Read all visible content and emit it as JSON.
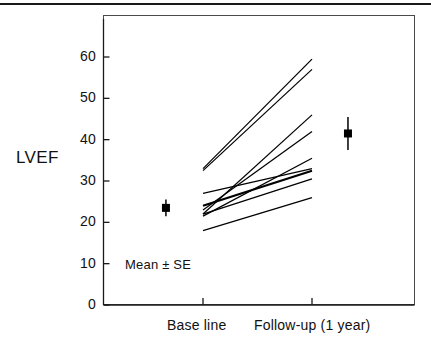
{
  "figure": {
    "axis_title_y": "LVEF",
    "annotation": "Mean ± SE",
    "rule_color": "#1a1a1a",
    "line_color": "#000000",
    "frame_color": "#4a4a4a"
  },
  "chart_data": {
    "type": "line",
    "title": "",
    "xlabel": "",
    "ylabel": "LVEF",
    "categories": [
      "Base line",
      "Follow-up (1 year)"
    ],
    "x": [
      0,
      1
    ],
    "ylim": [
      0,
      68
    ],
    "xlim": [
      -0.92,
      1.93
    ],
    "yticks": [
      0,
      10,
      20,
      30,
      40,
      50,
      60
    ],
    "ytick_labels": [
      "0",
      "10",
      "20",
      "30",
      "40",
      "50",
      "60"
    ],
    "xtick_labels": [
      "Base line",
      "Follow-up (1 year)"
    ],
    "grid": false,
    "legend": "none",
    "annotations": [
      {
        "text": "Mean ± SE",
        "x": 0.22,
        "y": 10
      }
    ],
    "series": [
      {
        "name": "patient-1",
        "values": [
          33.0,
          59.5
        ],
        "emphasis": false
      },
      {
        "name": "patient-2",
        "values": [
          32.5,
          57.0
        ],
        "emphasis": false
      },
      {
        "name": "patient-3",
        "values": [
          22.0,
          46.0
        ],
        "emphasis": false
      },
      {
        "name": "patient-4",
        "values": [
          23.0,
          42.0
        ],
        "emphasis": false
      },
      {
        "name": "patient-5",
        "values": [
          21.5,
          35.5
        ],
        "emphasis": false
      },
      {
        "name": "patient-6",
        "values": [
          27.0,
          33.0
        ],
        "emphasis": false
      },
      {
        "name": "patient-7",
        "values": [
          24.0,
          32.5
        ],
        "emphasis": true
      },
      {
        "name": "patient-8",
        "values": [
          22.0,
          30.5
        ],
        "emphasis": false
      },
      {
        "name": "patient-9",
        "values": [
          18.0,
          26.0
        ],
        "emphasis": false
      }
    ],
    "error_bars": [
      {
        "name": "baseline-mean",
        "x": -0.34,
        "mean": 23.5,
        "se": 2.0
      },
      {
        "name": "followup-mean",
        "x": 1.33,
        "mean": 41.5,
        "se": 4.0
      }
    ]
  }
}
